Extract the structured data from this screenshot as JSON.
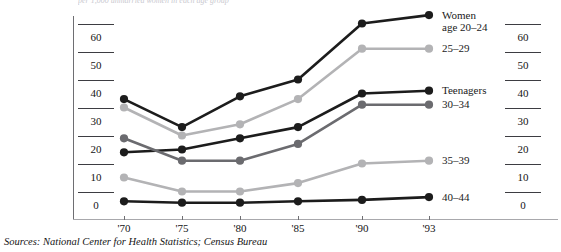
{
  "figure": {
    "clipped_header": "per 1,000 unmarried women in each age group",
    "source_note": "Sources: National Center for Health Statistics; Census Bureau"
  },
  "axes": {
    "y_ticks_left": [
      "60",
      "50",
      "40",
      "30",
      "20",
      "10",
      "0"
    ],
    "y_ticks_right": [
      "60",
      "50",
      "40",
      "30",
      "20",
      "10",
      "0"
    ],
    "x_ticks": [
      "'70",
      "'75",
      "'80",
      "'85",
      "'90",
      "'93"
    ]
  },
  "series_labels": {
    "s0": "Women\nage 20–24",
    "s1": "25–29",
    "s2": "Teenagers",
    "s3": "30–34",
    "s4": "35–39",
    "s5": "40–44"
  },
  "colors": {
    "black": "#1c1c1c",
    "dark_gray": "#6b6b6f",
    "light_gray": "#b3b3b5",
    "axis": "#8c8c90",
    "text": "#141414"
  },
  "chart_data": {
    "type": "line",
    "title": "",
    "subtitle": "",
    "xlabel": "",
    "ylabel": "",
    "x": [
      "'70",
      "'75",
      "'80",
      "'85",
      "'90",
      "'93"
    ],
    "x_numeric": [
      1970,
      1975,
      1980,
      1985,
      1990,
      1993
    ],
    "ylim": [
      0,
      70
    ],
    "yticks": [
      0,
      10,
      20,
      30,
      40,
      50,
      60
    ],
    "grid": false,
    "legend": "right-inline-end-of-line",
    "series": [
      {
        "name": "Women age 20–24",
        "color": "#1c1c1c",
        "values": [
          38,
          28,
          39,
          45,
          65,
          68
        ]
      },
      {
        "name": "25–29",
        "color": "#b3b3b5",
        "values": [
          35,
          25,
          29,
          38,
          56,
          56
        ]
      },
      {
        "name": "Teenagers",
        "color": "#1c1c1c",
        "values": [
          19,
          20,
          24,
          28,
          40,
          41
        ]
      },
      {
        "name": "30–34",
        "color": "#6b6b6f",
        "values": [
          24,
          16,
          16,
          22,
          36,
          36
        ]
      },
      {
        "name": "35–39",
        "color": "#b3b3b5",
        "values": [
          10,
          5,
          5,
          8,
          15,
          16
        ]
      },
      {
        "name": "40–44",
        "color": "#1c1c1c",
        "values": [
          1.5,
          1,
          1,
          1.5,
          2,
          3
        ]
      }
    ]
  }
}
